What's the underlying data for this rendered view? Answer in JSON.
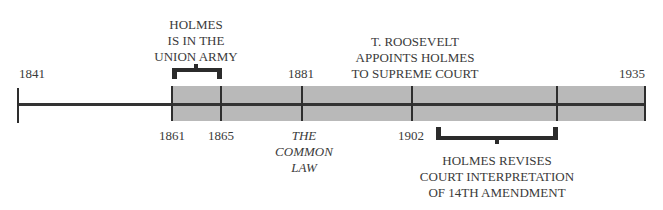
{
  "timeline": {
    "start_year": "1841",
    "end_year": "1935",
    "shaded_range": [
      "1861",
      "1935"
    ],
    "colors": {
      "band": "#b9b9b9",
      "line": "#333333",
      "text": "#3a3a3a"
    },
    "year_labels": {
      "y1841": "1841",
      "y1861": "1861",
      "y1865": "1865",
      "y1881": "1881",
      "y1902": "1902",
      "y1935": "1935"
    },
    "events": {
      "union_army": {
        "lines": [
          "HOLMES",
          "IS IN THE",
          "UNION ARMY"
        ],
        "range": [
          "1861",
          "1865"
        ]
      },
      "common_law": {
        "lines": [
          "THE",
          "COMMON",
          "LAW"
        ],
        "year": "1881"
      },
      "supreme_court": {
        "lines": [
          "T. ROOSEVELT",
          "APPOINTS HOLMES",
          "TO SUPREME COURT"
        ],
        "year": "1902"
      },
      "fourteenth_amendment": {
        "lines": [
          "HOLMES REVISES",
          "COURT INTERPRETATION",
          "OF 14TH AMENDMENT"
        ],
        "range_start": "1902"
      }
    }
  }
}
